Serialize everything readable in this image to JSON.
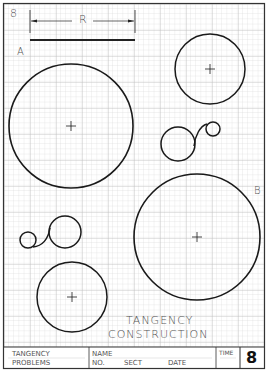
{
  "sheet": {
    "number_top": "8",
    "dimension_label": "R",
    "label_a": "A",
    "label_b": "B",
    "title_line1": "TANGENCY",
    "title_line2": "CONSTRUCTION"
  },
  "title_block": {
    "subject_line1": "TANGENCY",
    "subject_line2": "PROBLEMS",
    "name_label": "NAME",
    "no_label": "NO.",
    "sect_label": "SECT",
    "date_label": "DATE",
    "time_label": "TIME",
    "sheet_number": "8"
  },
  "colors": {
    "grid_minor": "#d8d8d8",
    "grid_major": "#b8b8b8",
    "ink": "#1a1a1a",
    "text": "#555555"
  },
  "figures": [
    {
      "id": "circle-A",
      "cx": 71,
      "cy": 126,
      "r": 62
    },
    {
      "id": "circle-top-right",
      "cx": 210,
      "cy": 69,
      "r": 35
    },
    {
      "id": "circle-B",
      "cx": 197,
      "cy": 237,
      "r": 63
    },
    {
      "id": "circle-bottom-left",
      "cx": 72,
      "cy": 297,
      "r": 35
    },
    {
      "id": "tangent-loop-right",
      "large": {
        "cx": 178,
        "cy": 144,
        "r": 17
      },
      "small": {
        "cx": 213,
        "cy": 129,
        "r": 7
      }
    },
    {
      "id": "tangent-loop-left",
      "large": {
        "cx": 65,
        "cy": 232,
        "r": 16
      },
      "small": {
        "cx": 28,
        "cy": 240,
        "r": 8
      }
    }
  ]
}
